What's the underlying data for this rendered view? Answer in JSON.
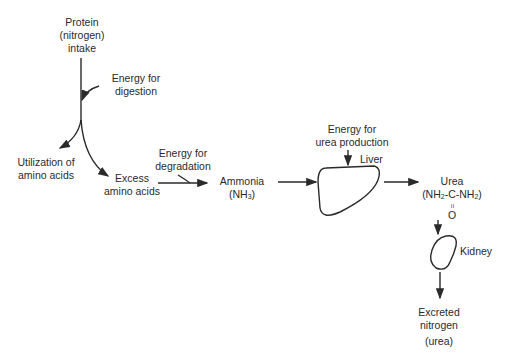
{
  "diagram": {
    "nodes": {
      "protein_intake": {
        "lines": [
          "Protein",
          "(nitrogen)",
          "intake"
        ]
      },
      "energy_digestion": {
        "lines": [
          "Energy for",
          "digestion"
        ]
      },
      "utilization": {
        "lines": [
          "Utilization of",
          "amino acids"
        ]
      },
      "excess": {
        "lines": [
          "Excess",
          "amino acids"
        ]
      },
      "energy_degradation": {
        "lines": [
          "Energy for",
          "degradation"
        ]
      },
      "ammonia": {
        "line1": "Ammonia",
        "line2_pre": "(NH",
        "line2_sub": "3",
        "line2_post": ")"
      },
      "energy_urea": {
        "lines": [
          "Energy for",
          "urea production"
        ]
      },
      "liver": {
        "label": "Liver"
      },
      "urea": {
        "line1": "Urea",
        "f_a": "(NH",
        "f_b": "2",
        "f_c": "-C-NH",
        "f_d": "2",
        "f_e": ")",
        "dbl": "=",
        "oxygen": "O"
      },
      "kidney": {
        "label": "Kidney"
      },
      "excreted": {
        "lines": [
          "Excreted",
          "nitrogen",
          "(urea)"
        ]
      }
    },
    "colors": {
      "stroke": "#2a2a2a",
      "background": "#ffffff"
    }
  }
}
